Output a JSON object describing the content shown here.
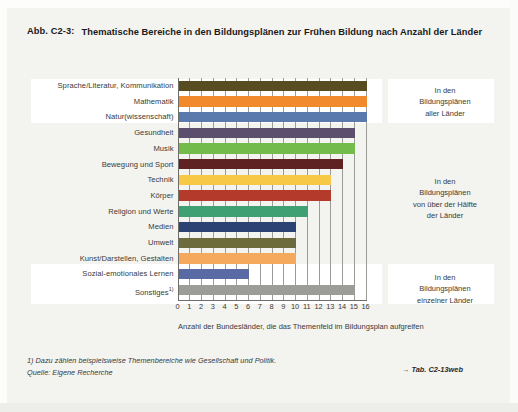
{
  "figure": {
    "number": "Abb. C2-3:",
    "title": "Thematische Bereiche in den Bildungsplänen zur Frühen Bildung nach Anzahl der Länder"
  },
  "footer": {
    "footnote": "1) Dazu zählen beispielsweise Themenbereiche wie Gesellschaft und Politik.",
    "source": "Quelle: Eigene Recherche",
    "table_ref_arrow": "→",
    "table_ref": "Tab. C2-13web"
  },
  "annotations": [
    {
      "id": "ann-1",
      "text": "In den\nBildungsplänen\naller Länder"
    },
    {
      "id": "ann-2",
      "text": "In den\nBildungsplänen\nvon über der Hälfte\nder Länder"
    },
    {
      "id": "ann-3",
      "text": "In den\nBildungsplänen\neinzelner Länder"
    }
  ],
  "chart_data": {
    "type": "bar",
    "orientation": "horizontal",
    "title": "Thematische Bereiche in den Bildungsplänen zur Frühen Bildung nach Anzahl der Länder",
    "xlabel": "Anzahl der Bundesländer, die das Themenfeld im Bildungsplan aufgreifen",
    "ylabel": "",
    "xlim": [
      0,
      16
    ],
    "xticks": [
      0,
      1,
      2,
      3,
      4,
      5,
      6,
      7,
      8,
      9,
      10,
      11,
      12,
      13,
      14,
      15,
      16
    ],
    "grid": true,
    "legend": "none",
    "categories": [
      "Sprache/Literatur, Kommunikation",
      "Mathematik",
      "Natur(wissenschaft)",
      "Gesundheit",
      "Musik",
      "Bewegung und Sport",
      "Technik",
      "Körper",
      "Religion und Werte",
      "Medien",
      "Umwelt",
      "Kunst/Darstellen, Gestalten",
      "Sozial-emotionales Lernen",
      "Sonstiges"
    ],
    "values": [
      16,
      16,
      16,
      15,
      15,
      14,
      13,
      13,
      11,
      10,
      10,
      10,
      6,
      15
    ],
    "colors": [
      "#574d20",
      "#f08a2c",
      "#5a79ad",
      "#5c4f6e",
      "#73bb4a",
      "#5e2222",
      "#f7c845",
      "#b43a2c",
      "#3fa173",
      "#2c4272",
      "#6d6b3c",
      "#f5a95c",
      "#5a6aa5",
      "#9c9c98"
    ],
    "bars": [
      {
        "label": "Sprache/Literatur, Kommunikation",
        "footnote": "",
        "value": 16,
        "color": "#574d20"
      },
      {
        "label": "Mathematik",
        "footnote": "",
        "value": 16,
        "color": "#f08a2c"
      },
      {
        "label": "Natur(wissenschaft)",
        "footnote": "",
        "value": 16,
        "color": "#5a79ad"
      },
      {
        "label": "Gesundheit",
        "footnote": "",
        "value": 15,
        "color": "#5c4f6e"
      },
      {
        "label": "Musik",
        "footnote": "",
        "value": 15,
        "color": "#73bb4a"
      },
      {
        "label": "Bewegung und Sport",
        "footnote": "",
        "value": 14,
        "color": "#5e2222"
      },
      {
        "label": "Technik",
        "footnote": "",
        "value": 13,
        "color": "#f7c845"
      },
      {
        "label": "Körper",
        "footnote": "",
        "value": 13,
        "color": "#b43a2c"
      },
      {
        "label": "Religion und Werte",
        "footnote": "",
        "value": 11,
        "color": "#3fa173"
      },
      {
        "label": "Medien",
        "footnote": "",
        "value": 10,
        "color": "#2c4272"
      },
      {
        "label": "Umwelt",
        "footnote": "",
        "value": 10,
        "color": "#6d6b3c"
      },
      {
        "label": "Kunst/Darstellen, Gestalten",
        "footnote": "",
        "value": 10,
        "color": "#f5a95c"
      },
      {
        "label": "Sozial-emotionales Lernen",
        "footnote": "",
        "value": 6,
        "color": "#5a6aa5"
      },
      {
        "label": "Sonstiges",
        "footnote": "1)",
        "value": 15,
        "color": "#9c9c98"
      }
    ]
  }
}
